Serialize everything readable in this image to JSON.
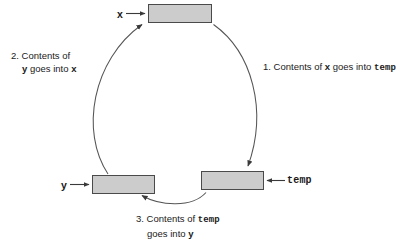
{
  "diagram": {
    "title_present": false,
    "background_color": "#ffffff",
    "box_fill_color": "#cccccc",
    "box_border_color": "#4a4a4a",
    "stroke_color": "#555555",
    "boxes": [
      {
        "id": "x",
        "label": "x",
        "label_style": "bold-sans"
      },
      {
        "id": "y",
        "label": "y",
        "label_style": "bold-sans"
      },
      {
        "id": "temp",
        "label": "temp",
        "label_style": "bold-mono"
      }
    ],
    "labels": {
      "x": "x",
      "y": "y",
      "temp": "temp"
    },
    "steps": [
      {
        "number": "1.",
        "text_parts": [
          {
            "t": "Contents of ",
            "style": "plain"
          },
          {
            "t": "x",
            "style": "var"
          },
          {
            "t": " goes into ",
            "style": "plain"
          },
          {
            "t": "temp",
            "style": "code"
          }
        ],
        "line1": "1. Contents of x goes into temp",
        "line2": ""
      },
      {
        "number": "2.",
        "line1": "2.  Contents of",
        "line2": "y goes into x"
      },
      {
        "number": "3.",
        "line1": "3. Contents of temp",
        "line2": "goes into y"
      }
    ],
    "step1": {
      "num": "1.",
      "seg1": " Contents of ",
      "var1": "x",
      "seg2": " goes into ",
      "code1": "temp"
    },
    "step2": {
      "num": "2.",
      "seg1": "  Contents of",
      "var1": "y",
      "seg2": " goes into ",
      "var2": "x"
    },
    "step3": {
      "num": "3.",
      "seg1": " Contents of ",
      "code1": "temp",
      "seg2": "goes into ",
      "var1": "y"
    },
    "arrows": [
      {
        "id": "arrow-into-x-box",
        "from": "x label",
        "to": "x box",
        "kind": "straight"
      },
      {
        "id": "arrow-into-y-box",
        "from": "y label",
        "to": "y box",
        "kind": "straight"
      },
      {
        "id": "arrow-into-temp-box",
        "from": "temp label",
        "to": "temp box",
        "kind": "straight"
      },
      {
        "id": "arrow-x-to-temp",
        "from": "x box",
        "to": "temp box",
        "kind": "curved",
        "step": "1"
      },
      {
        "id": "arrow-y-to-x",
        "from": "y box",
        "to": "x box",
        "kind": "curved",
        "step": "2"
      },
      {
        "id": "arrow-temp-to-y",
        "from": "temp box",
        "to": "y box",
        "kind": "curved",
        "step": "3"
      }
    ]
  }
}
